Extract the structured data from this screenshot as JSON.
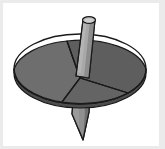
{
  "figure": {
    "alt_text": "Three-dimensional line drawing of a spinning top: an elliptical disc split into three wedge segments with a cylindrical shaft through the centre and a tapered point below",
    "background_color": "#ffffff",
    "frame_color": "#ebebeb",
    "outline_color": "#1a1a1a",
    "canvas": {
      "width": 165,
      "height": 149
    }
  },
  "disc": {
    "label": "disc",
    "center_x": 80,
    "center_y": 69,
    "radius_x": 66,
    "radius_y": 35,
    "outline_color": "#1a1a1a",
    "outline_width": 1.3,
    "rim_color": "#4d4d4d"
  },
  "segments": [
    {
      "name": "segment-left",
      "label": "Left wedge",
      "fill": "#6e6e6e"
    },
    {
      "name": "segment-right",
      "label": "Right wedge",
      "fill": "#5e5e5e"
    },
    {
      "name": "segment-front",
      "label": "Front wedge",
      "fill": "#646464"
    }
  ],
  "shaft": {
    "label": "shaft",
    "fill": "#a8a8a8",
    "fill_shadow": "#8d8d8d",
    "cap_fill": "#bdbdbd",
    "outline_color": "#1a1a1a",
    "top_y": 16,
    "bottom_y": 72,
    "width": 13
  },
  "spike": {
    "label": "spike",
    "fill": "#909090",
    "fill_shadow": "#6f6f6f",
    "outline_color": "#1a1a1a",
    "tip_x": 83,
    "tip_y": 140
  }
}
